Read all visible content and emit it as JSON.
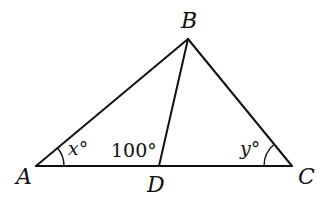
{
  "diagram": {
    "type": "triangle-with-cevian",
    "points": {
      "A": {
        "label": "A",
        "x": 36,
        "y": 166
      },
      "B": {
        "label": "B",
        "x": 188,
        "y": 39
      },
      "C": {
        "label": "C",
        "x": 292,
        "y": 166
      },
      "D": {
        "label": "D",
        "x": 159,
        "y": 166
      }
    },
    "segments": [
      "AB",
      "BC",
      "AC",
      "BD"
    ],
    "angles": {
      "at_A": {
        "var": "x",
        "degree": "°",
        "text": "x°"
      },
      "at_D": {
        "text": "100°"
      },
      "at_C": {
        "var": "y",
        "degree": "°",
        "text": "y°"
      }
    }
  }
}
